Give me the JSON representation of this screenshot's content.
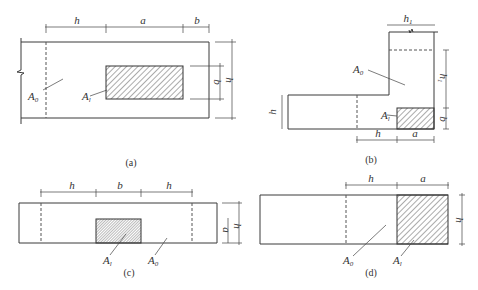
{
  "figure": {
    "diagrams": [
      {
        "id": "a",
        "caption": "(a)",
        "dimensions": {
          "top": [
            "h",
            "a",
            "b"
          ],
          "right_inner": "b",
          "right_outer": "h"
        },
        "area_labels": {
          "A0": "A",
          "A0_sub": "0",
          "Al": "A",
          "Al_sub": "l"
        }
      },
      {
        "id": "b",
        "caption": "(b)",
        "dimensions": {
          "top": "h1",
          "top_base": "h",
          "top_sub": "1",
          "right_upper": "h1",
          "right_upper_base": "h",
          "right_upper_sub": "1",
          "right_lower": "b",
          "left": "h",
          "bottom": [
            "h",
            "a"
          ]
        },
        "area_labels": {
          "A0": "A",
          "A0_sub": "0",
          "Al": "A",
          "Al_sub": "l"
        }
      },
      {
        "id": "c",
        "caption": "(c)",
        "dimensions": {
          "top": [
            "h",
            "b",
            "h"
          ],
          "right_inner": "a",
          "right_outer": "h"
        },
        "area_labels": {
          "A0": "A",
          "A0_sub": "0",
          "Al": "A",
          "Al_sub": "l"
        }
      },
      {
        "id": "d",
        "caption": "(d)",
        "dimensions": {
          "top": [
            "h",
            "a"
          ],
          "right": "h"
        },
        "area_labels": {
          "A0": "A",
          "A0_sub": "0",
          "Al": "A",
          "Al_sub": "l"
        }
      }
    ],
    "colors": {
      "line": "#3a3a3a",
      "hatch": "#444444",
      "background": "#ffffff"
    }
  }
}
